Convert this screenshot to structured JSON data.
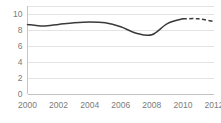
{
  "chart_data": {
    "type": "line",
    "title": "",
    "subtitle": "",
    "xlabel": "",
    "ylabel": "",
    "xlim": [
      2000,
      2012
    ],
    "ylim": [
      0,
      11
    ],
    "grid": true,
    "legend": false,
    "legend_position": "none",
    "x_tick_labels": [
      "2000",
      "2002",
      "2004",
      "2006",
      "2008",
      "2010",
      "2012"
    ],
    "x_tick_values": [
      2000,
      2002,
      2004,
      2006,
      2008,
      2010,
      2012
    ],
    "y_tick_labels": [
      "0",
      "2",
      "4",
      "6",
      "8",
      "10"
    ],
    "y_tick_values": [
      0,
      2,
      4,
      6,
      8,
      10
    ],
    "line_color": "#3a3a3a",
    "grid_color": "#d9d9d9",
    "tick_label_color": "#7b7b7b",
    "x": [
      2000,
      2001,
      2002,
      2003,
      2004,
      2005,
      2006,
      2007,
      2008,
      2009,
      2010,
      2011,
      2012
    ],
    "series": [
      {
        "name": "actual",
        "style": "solid",
        "x": [
          2000,
          2001,
          2002,
          2003,
          2004,
          2005,
          2006,
          2007,
          2008,
          2009,
          2010
        ],
        "values": [
          8.7,
          8.5,
          8.7,
          8.9,
          9.0,
          8.9,
          8.4,
          7.6,
          7.4,
          8.8,
          9.4
        ]
      },
      {
        "name": "projection",
        "style": "dashed",
        "x": [
          2010,
          2011,
          2012
        ],
        "values": [
          9.4,
          9.4,
          9.05
        ]
      }
    ],
    "annotations": []
  }
}
